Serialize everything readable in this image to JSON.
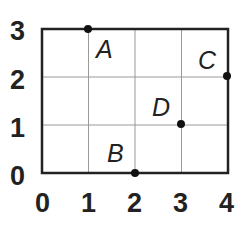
{
  "diagram": {
    "type": "coordinate-grid",
    "x_ticks": [
      "0",
      "1",
      "2",
      "3",
      "4"
    ],
    "y_ticks": [
      "0",
      "1",
      "2",
      "3"
    ],
    "points": [
      {
        "label": "A",
        "x": 1,
        "y": 3
      },
      {
        "label": "B",
        "x": 2,
        "y": 0
      },
      {
        "label": "C",
        "x": 4,
        "y": 2
      },
      {
        "label": "D",
        "x": 3,
        "y": 1
      }
    ],
    "colors": {
      "border": "#222222",
      "grid": "#9a9a9a",
      "point": "#111111"
    }
  }
}
